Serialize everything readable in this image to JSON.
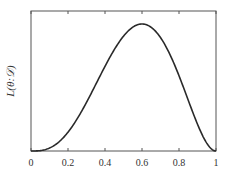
{
  "chart_data": {
    "type": "line",
    "title": "",
    "xlabel": "",
    "ylabel": "L(θ:𝒟)",
    "xlim": [
      0,
      1
    ],
    "ylim": [
      0,
      0.0375
    ],
    "grid": false,
    "legend": null,
    "x_ticks": [
      "0",
      "0.2",
      "0.4",
      "0.6",
      "0.8",
      "1"
    ],
    "y_ticks": [],
    "series": [
      {
        "name": "likelihood",
        "formula": "θ^3 (1-θ)^2",
        "color": "#2a2a2a",
        "x": [
          0,
          0.05,
          0.1,
          0.15,
          0.2,
          0.25,
          0.3,
          0.35,
          0.4,
          0.45,
          0.5,
          0.55,
          0.6,
          0.65,
          0.7,
          0.75,
          0.8,
          0.85,
          0.9,
          0.95,
          1
        ],
        "y": [
          0,
          0.000113,
          0.00081,
          0.002438,
          0.00512,
          0.008789,
          0.01323,
          0.018114,
          0.02304,
          0.027565,
          0.03125,
          0.033691,
          0.03456,
          0.033634,
          0.03087,
          0.026367,
          0.02048,
          0.013817,
          0.00729,
          0.002143,
          0
        ]
      }
    ],
    "peak": {
      "x": 0.6,
      "y": 0.03456
    }
  },
  "colors": {
    "frame": "#555555",
    "curve": "#2a2a2a",
    "text": "#333333"
  }
}
